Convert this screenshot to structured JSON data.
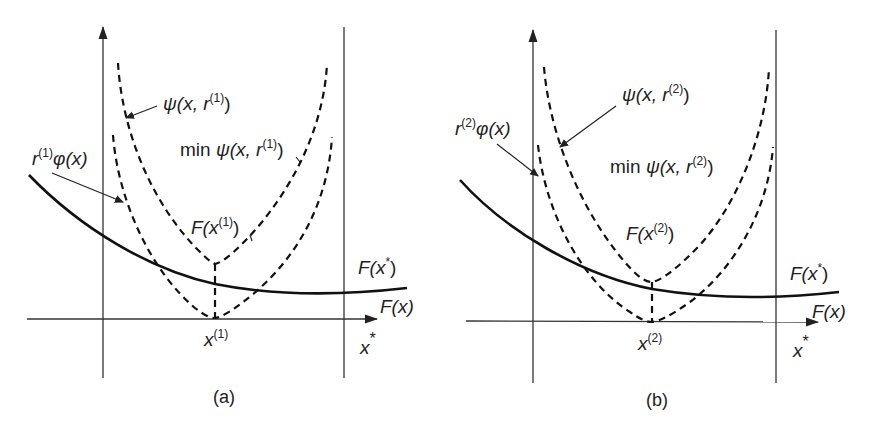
{
  "figure": {
    "panels": [
      {
        "id": "a",
        "caption": "(a)",
        "iteration": "1",
        "labels": {
          "psi_curve": {
            "fn": "ψ",
            "arg": "(x, r",
            "sup": "(1)",
            "close": ")"
          },
          "penalty_term": {
            "coef": "r",
            "sup": "(1)",
            "fn": "φ(x)"
          },
          "min_psi": {
            "prefix": "min ",
            "fn": "ψ",
            "arg": "(x, r",
            "sup": "(1)",
            "close": ")"
          },
          "F_at_xk": {
            "fn": "F(x",
            "sup": "(1)",
            "close": ")"
          },
          "F_at_xstar": {
            "fn": "F(x",
            "sup": "*",
            "close": ")"
          },
          "F_x": "F(x)",
          "xk_tick": {
            "base": "x",
            "sup": "(1)"
          },
          "xstar": {
            "base": "x",
            "sup": "*"
          }
        }
      },
      {
        "id": "b",
        "caption": "(b)",
        "iteration": "2",
        "labels": {
          "psi_curve": {
            "fn": "ψ",
            "arg": "(x, r",
            "sup": "(2)",
            "close": ")"
          },
          "penalty_term": {
            "coef": "r",
            "sup": "(2)",
            "fn": "φ(x)"
          },
          "min_psi": {
            "prefix": "min ",
            "fn": "ψ",
            "arg": "(x, r",
            "sup": "(2)",
            "close": ")"
          },
          "F_at_xk": {
            "fn": "F(x",
            "sup": "(2)",
            "close": ")"
          },
          "F_at_xstar": {
            "fn": "F(x",
            "sup": "*",
            "close": ")"
          },
          "F_x": "F(x)",
          "xk_tick": {
            "base": "x",
            "sup": "(2)"
          },
          "xstar": {
            "base": "x",
            "sup": "*"
          }
        }
      }
    ],
    "colors": {
      "line": "#111111",
      "axis": "#333333",
      "background": "#ffffff"
    }
  }
}
